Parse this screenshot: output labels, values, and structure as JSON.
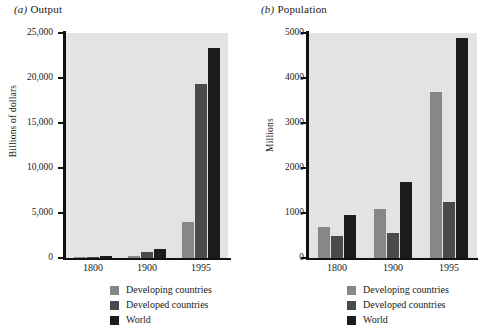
{
  "figure": {
    "panels": [
      {
        "id": "output",
        "label_prefix": "(a)",
        "title": "Output",
        "ylabel": "Billions of dollars",
        "yticks": [
          "0",
          "5,000",
          "10,000",
          "15,000",
          "20,000",
          "25,000"
        ],
        "xticks": [
          "1800",
          "1900",
          "1995"
        ],
        "legend": [
          "Developing countries",
          "Developed countries",
          "World"
        ]
      },
      {
        "id": "population",
        "label_prefix": "(b)",
        "title": "Population",
        "ylabel": "Millions",
        "yticks": [
          "0",
          "1000",
          "2000",
          "3000",
          "4000",
          "5000"
        ],
        "xticks": [
          "1800",
          "1900",
          "1995"
        ],
        "legend": [
          "Developing countries",
          "Developed countries",
          "World"
        ]
      }
    ]
  },
  "colors": {
    "developing": "#878787",
    "developed": "#4a4a4a",
    "world": "#1c1c1c",
    "plot_background": "#e3e3e3",
    "axis": "#111111",
    "page_background": "#ffffff"
  },
  "chart_data": [
    {
      "type": "bar",
      "title": "(a) Output",
      "xlabel": "",
      "ylabel": "Billions of dollars",
      "categories": [
        "1800",
        "1900",
        "1995"
      ],
      "series": [
        {
          "name": "Developing countries",
          "values": [
            120,
            210,
            4000
          ],
          "color": "#878787"
        },
        {
          "name": "Developed countries",
          "values": [
            130,
            700,
            19300
          ],
          "color": "#4a4a4a"
        },
        {
          "name": "World",
          "values": [
            250,
            1000,
            23300
          ],
          "color": "#1c1c1c"
        }
      ],
      "ylim": [
        0,
        25000
      ],
      "ytick_values": [
        0,
        5000,
        10000,
        15000,
        20000,
        25000
      ],
      "grid": false,
      "legend_position": "bottom"
    },
    {
      "type": "bar",
      "title": "(b) Population",
      "xlabel": "",
      "ylabel": "Millions",
      "categories": [
        "1800",
        "1900",
        "1995"
      ],
      "series": [
        {
          "name": "Developing countries",
          "values": [
            700,
            1100,
            3700
          ],
          "color": "#878787"
        },
        {
          "name": "Developed countries",
          "values": [
            500,
            560,
            1250
          ],
          "color": "#4a4a4a"
        },
        {
          "name": "World",
          "values": [
            950,
            1700,
            4900
          ],
          "color": "#1c1c1c"
        }
      ],
      "ylim": [
        0,
        5000
      ],
      "ytick_values": [
        0,
        1000,
        2000,
        3000,
        4000,
        5000
      ],
      "grid": false,
      "legend_position": "bottom"
    }
  ]
}
